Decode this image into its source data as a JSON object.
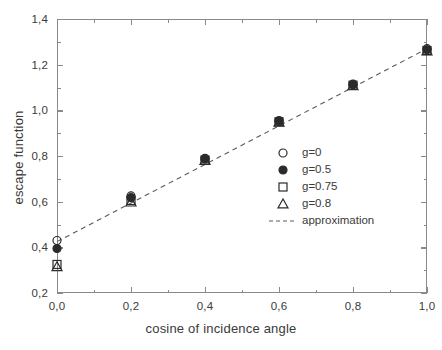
{
  "chart_data": {
    "type": "scatter",
    "title": "",
    "xlabel": "cosine of  incidence angle",
    "ylabel": "escape function",
    "xlim": [
      0.0,
      1.0
    ],
    "ylim": [
      0.2,
      1.4
    ],
    "xticks": [
      0.0,
      0.2,
      0.4,
      0.6,
      0.8,
      1.0
    ],
    "yticks": [
      0.2,
      0.4,
      0.6,
      0.8,
      1.0,
      1.2,
      1.4
    ],
    "xticklabels": [
      "0,0",
      "0,2",
      "0,4",
      "0,6",
      "0,8",
      "1,0"
    ],
    "yticklabels": [
      "0,2",
      "0,4",
      "0,6",
      "0,8",
      "1,0",
      "1,2",
      "1,4"
    ],
    "minor_ticks": true,
    "grid": false,
    "legend_position": "center right",
    "x": [
      0.0,
      0.2,
      0.4,
      0.6,
      0.8,
      1.0
    ],
    "series": [
      {
        "name": "g=0",
        "marker": "open-circle",
        "values": [
          0.43,
          0.625,
          0.79,
          0.955,
          1.115,
          1.27
        ]
      },
      {
        "name": "g=0.5",
        "marker": "filled-circle",
        "values": [
          0.395,
          0.618,
          0.787,
          0.952,
          1.112,
          1.265
        ]
      },
      {
        "name": "g=0.75",
        "marker": "open-square",
        "values": [
          0.325,
          0.605,
          0.782,
          0.95,
          1.11,
          1.262
        ]
      },
      {
        "name": "g=0.8",
        "marker": "open-triangle",
        "values": [
          0.315,
          0.598,
          0.78,
          0.948,
          1.108,
          1.26
        ]
      },
      {
        "name": "approximation",
        "marker": "dashed-line",
        "line": {
          "intercept": 0.425,
          "slope": 0.845
        },
        "values": [
          0.425,
          0.594,
          0.763,
          0.932,
          1.101,
          1.27
        ]
      }
    ]
  },
  "legend": {
    "entries": [
      {
        "label": "g=0",
        "marker": "open-circle"
      },
      {
        "label": "g=0.5",
        "marker": "filled-circle"
      },
      {
        "label": "g=0.75",
        "marker": "open-square"
      },
      {
        "label": "g=0.8",
        "marker": "open-triangle"
      },
      {
        "label": "approximation",
        "marker": "dashed-line"
      }
    ]
  },
  "colors": {
    "axis": "#8a8a8a",
    "text": "#3a3a3a",
    "marker": "#2b2b2b",
    "line": "#5a5a5a",
    "background": "#ffffff"
  }
}
